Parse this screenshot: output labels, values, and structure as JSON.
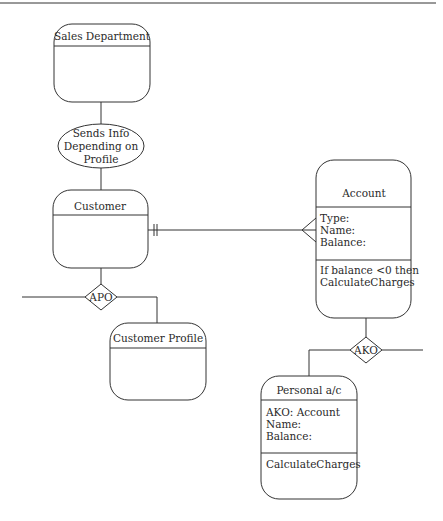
{
  "diagram": {
    "type": "object-relationship diagram",
    "colors": {
      "stroke": "#333333",
      "background": "#ffffff",
      "text": "#2a2a2a"
    },
    "entities": [
      {
        "id": "sales",
        "title": "Sales Department",
        "sections": []
      },
      {
        "id": "customer",
        "title": "Customer",
        "sections": []
      },
      {
        "id": "customer_profile",
        "title": "Customer Profile",
        "sections": []
      },
      {
        "id": "account",
        "title": "Account",
        "attributes": [
          "Type:",
          "Name:",
          "Balance:"
        ],
        "methods": [
          "If balance <0 then",
          "CalculateCharges"
        ]
      },
      {
        "id": "personal",
        "title": "Personal a/c",
        "attributes": [
          "AKO: Account",
          "Name:",
          "Balance:"
        ],
        "methods": [
          "CalculateCharges"
        ]
      }
    ],
    "processes": [
      {
        "id": "sends_info",
        "lines": [
          "Sends Info",
          "Depending on",
          "Profile"
        ]
      }
    ],
    "relationships": [
      {
        "id": "apo",
        "label": "APO"
      },
      {
        "id": "ako",
        "label": "AKO"
      }
    ],
    "links": [
      {
        "from": "Sales Department",
        "to": "Sends Info Depending on Profile"
      },
      {
        "from": "Sends Info Depending on Profile",
        "to": "Customer"
      },
      {
        "from": "Customer",
        "to": "Account",
        "from_cardinality": "one-and-only-one",
        "to_cardinality": "many"
      },
      {
        "from": "Customer",
        "to": "APO"
      },
      {
        "from": "APO",
        "to": "Customer Profile"
      },
      {
        "from": "Account",
        "to": "AKO"
      },
      {
        "from": "AKO",
        "to": "Personal a/c"
      }
    ]
  }
}
